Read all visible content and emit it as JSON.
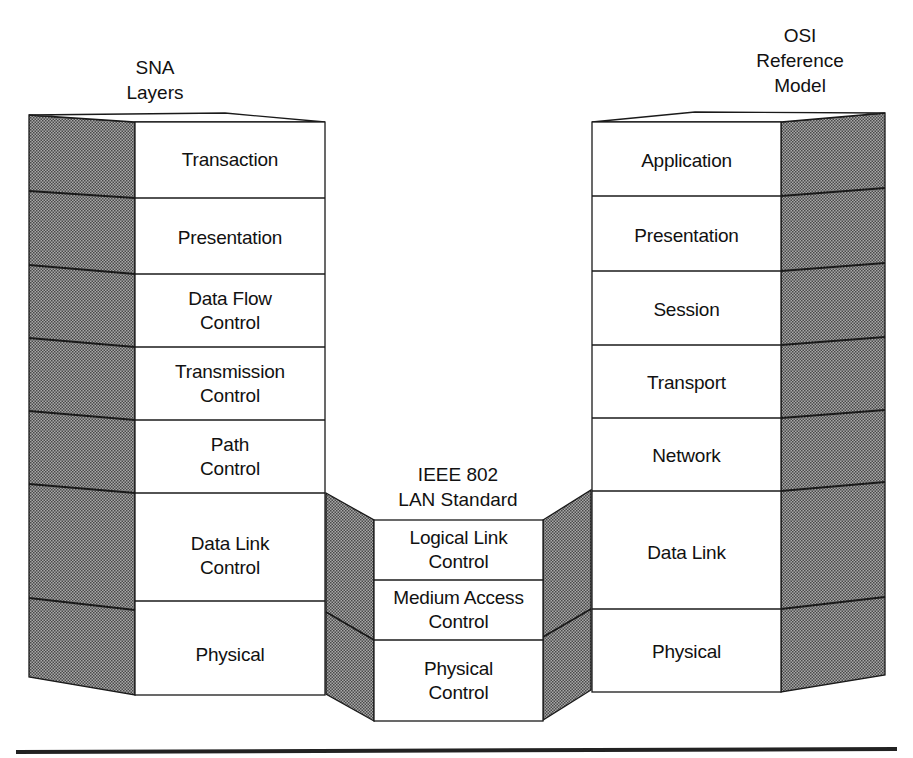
{
  "diagram": {
    "colors": {
      "stroke": "#1a1a1a",
      "face": "#ffffff",
      "shade": "#9a9a9a",
      "shade_dot": "#5c5c5c",
      "rule": "#222222"
    },
    "sna": {
      "title_line1": "SNA",
      "title_line2": "Layers",
      "layers": [
        {
          "line1": "Transaction",
          "line2": ""
        },
        {
          "line1": "Presentation",
          "line2": ""
        },
        {
          "line1": "Data Flow",
          "line2": "Control"
        },
        {
          "line1": "Transmission",
          "line2": "Control"
        },
        {
          "line1": "Path",
          "line2": "Control"
        },
        {
          "line1": "Data Link",
          "line2": "Control"
        },
        {
          "line1": "Physical",
          "line2": ""
        }
      ]
    },
    "ieee": {
      "title_line1": "IEEE 802",
      "title_line2": "LAN Standard",
      "layers": [
        {
          "line1": "Logical Link",
          "line2": "Control"
        },
        {
          "line1": "Medium Access",
          "line2": "Control"
        },
        {
          "line1": "Physical",
          "line2": "Control"
        }
      ]
    },
    "osi": {
      "title_line1": "OSI",
      "title_line2": "Reference",
      "title_line3": "Model",
      "layers": [
        {
          "line1": "Application",
          "line2": ""
        },
        {
          "line1": "Presentation",
          "line2": ""
        },
        {
          "line1": "Session",
          "line2": ""
        },
        {
          "line1": "Transport",
          "line2": ""
        },
        {
          "line1": "Network",
          "line2": ""
        },
        {
          "line1": "Data Link",
          "line2": ""
        },
        {
          "line1": "Physical",
          "line2": ""
        }
      ]
    }
  }
}
